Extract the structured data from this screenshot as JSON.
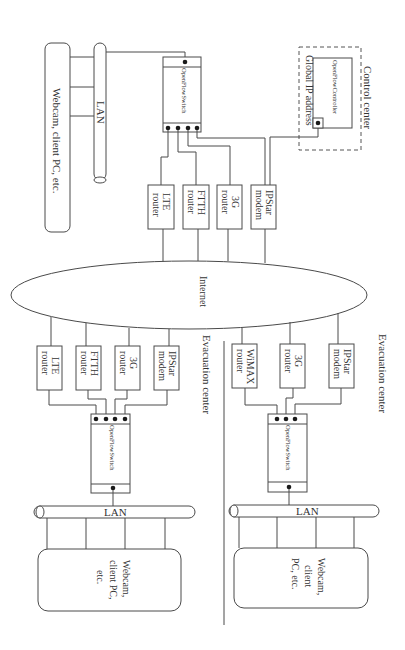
{
  "diagram": {
    "orientation": "rotated 90 degrees clockwise",
    "internet": {
      "label": "Internet"
    },
    "control_center": {
      "label": "Control center",
      "controller_label": "OpenFlowController",
      "ip_label": "Global IP address"
    },
    "main_site": {
      "switch_label": "OpenFlowSwitch",
      "lan_label": "LAN",
      "hosts_label": "Webcam, client PC, etc.",
      "devices": [
        {
          "line1": "LTE",
          "line2": "router"
        },
        {
          "line1": "FTTH",
          "line2": "router"
        },
        {
          "line1": "3G",
          "line2": "router"
        },
        {
          "line1": "IPStar",
          "line2": "modem"
        }
      ]
    },
    "evac_center_1": {
      "label": "Evacuation center",
      "switch_label": "OpenFlowSwitch",
      "lan_label": "LAN",
      "hosts_lines": [
        "Webcam,",
        "client PC,",
        "etc."
      ],
      "devices": [
        {
          "line1": "LTE",
          "line2": "router"
        },
        {
          "line1": "FTTH",
          "line2": "router"
        },
        {
          "line1": "3G",
          "line2": "router"
        },
        {
          "line1": "IPStar",
          "line2": "modem"
        }
      ]
    },
    "evac_center_2": {
      "label": "Evacuation center",
      "switch_label": "OpenFlowSwitch",
      "lan_label": "LAN",
      "hosts_lines": [
        "Webcam,",
        "client",
        "PC, etc."
      ],
      "devices": [
        {
          "line1": "WiMAX",
          "line2": "router"
        },
        {
          "line1": "3G",
          "line2": "router"
        },
        {
          "line1": "IPStar",
          "line2": "modem"
        }
      ]
    }
  }
}
